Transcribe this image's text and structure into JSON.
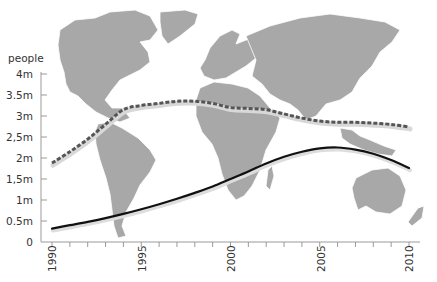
{
  "chart_data": {
    "type": "line",
    "title": "",
    "xlabel": "",
    "ylabel": "people",
    "background": "world map (grayscale)",
    "x": [
      1990,
      1991,
      1992,
      1993,
      1994,
      1995,
      1996,
      1997,
      1998,
      1999,
      2000,
      2001,
      2002,
      2003,
      2004,
      2005,
      2006,
      2007,
      2008,
      2009,
      2010
    ],
    "xticks_labeled": [
      "1990",
      "1995",
      "2000",
      "2005",
      "2010"
    ],
    "xlim": [
      1990,
      2010
    ],
    "yticks": [
      "0",
      "0.5m",
      "1m",
      "1,5m",
      "2m",
      "2,5m",
      "3m",
      "3.5m",
      "4m"
    ],
    "ylim": [
      0,
      4
    ],
    "grid": false,
    "legend": null,
    "series": [
      {
        "name": "dashed series",
        "style": "dashed",
        "color": "#555555",
        "values": [
          1.88,
          2.15,
          2.45,
          2.8,
          3.15,
          3.25,
          3.3,
          3.35,
          3.35,
          3.3,
          3.2,
          3.18,
          3.15,
          3.05,
          2.95,
          2.88,
          2.85,
          2.85,
          2.83,
          2.8,
          2.74
        ]
      },
      {
        "name": "solid series",
        "style": "solid",
        "color": "#111111",
        "values": [
          0.32,
          0.4,
          0.48,
          0.57,
          0.67,
          0.78,
          0.9,
          1.03,
          1.17,
          1.32,
          1.5,
          1.68,
          1.87,
          2.03,
          2.15,
          2.23,
          2.25,
          2.2,
          2.1,
          1.95,
          1.76
        ]
      }
    ]
  },
  "axis": {
    "unit_label": "people",
    "y_labels": [
      "4m",
      "3.5m",
      "3m",
      "2,5m",
      "2m",
      "1,5m",
      "1m",
      "0.5m",
      "0"
    ],
    "x_labels": [
      "1990",
      "1995",
      "2000",
      "2005",
      "2010"
    ]
  }
}
